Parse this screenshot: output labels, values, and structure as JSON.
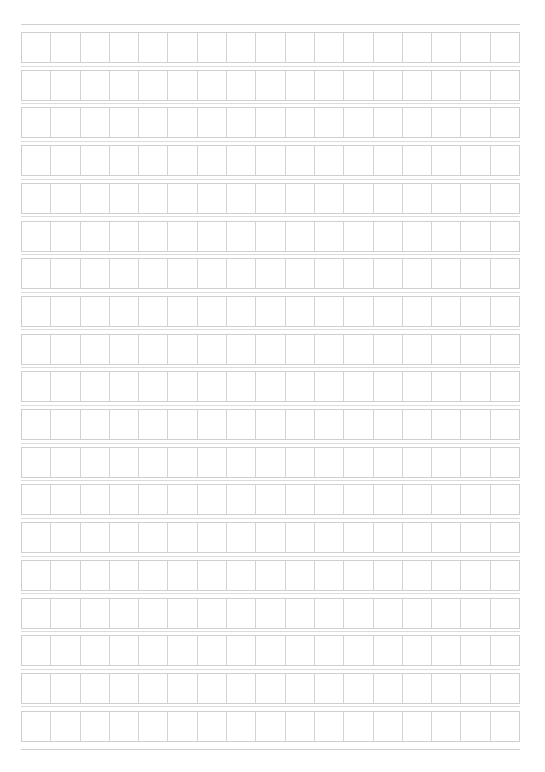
{
  "document": {
    "type": "manuscript-grid-paper",
    "rows": 19,
    "columns": 17,
    "line_color": "#cfcfcf",
    "background": "#ffffff"
  }
}
